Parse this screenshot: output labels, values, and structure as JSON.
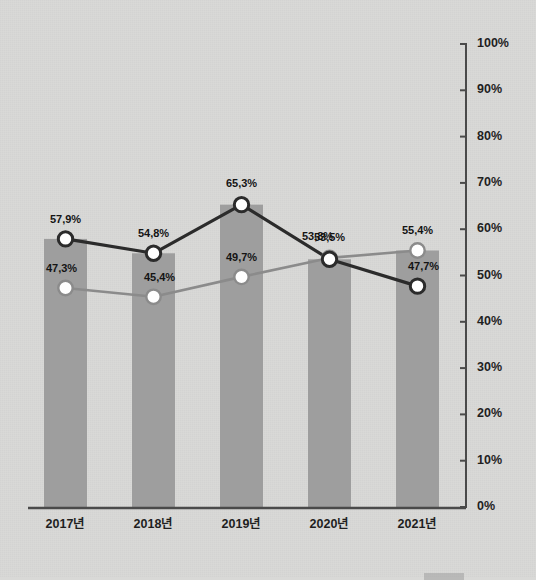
{
  "chart_data": {
    "type": "bar",
    "title": "",
    "subtitle": "",
    "xlabel": "",
    "ylabel": "",
    "categories": [
      "2017년",
      "2018년",
      "2019년",
      "2020년",
      "2021년"
    ],
    "ylim": [
      0,
      100
    ],
    "ytick_values": [
      0,
      10,
      20,
      30,
      40,
      50,
      60,
      70,
      80,
      90,
      100
    ],
    "ytick_labels": [
      "0%",
      "10%",
      "20%",
      "30%",
      "40%",
      "50%",
      "60%",
      "70%",
      "80%",
      "90%",
      "100%"
    ],
    "grid": false,
    "axis_position": "right",
    "legend_position": "bottom-right",
    "series": [
      {
        "name": "bar-series",
        "type": "bar",
        "color": "#9e9e9e",
        "values": [
          57.9,
          54.8,
          65.3,
          53.5,
          55.4
        ],
        "labels": [
          "57,9%",
          "54,8%",
          "65,3%",
          "53,5%",
          "55,4%"
        ]
      },
      {
        "name": "dark-line-series",
        "type": "line",
        "color": "#2b2b2b",
        "marker": "circle-white-fill-dark-ring",
        "values": [
          57.9,
          54.8,
          65.3,
          53.5,
          47.7
        ],
        "labels": [
          "57,9%",
          "54,8%",
          "65,3%",
          "53,5%",
          "47,7%"
        ]
      },
      {
        "name": "light-line-series",
        "type": "line",
        "color": "#8b8b8b",
        "marker": "circle-white-fill-gray-ring",
        "values": [
          47.3,
          45.4,
          49.7,
          53.8,
          55.4
        ],
        "labels": [
          "47,3%",
          "45,4%",
          "49,7%",
          "53,8%",
          "55,4%"
        ]
      }
    ]
  },
  "axis": {
    "ticks": [
      {
        "label": "100%",
        "value": 100
      },
      {
        "label": "90%",
        "value": 90
      },
      {
        "label": "80%",
        "value": 80
      },
      {
        "label": "70%",
        "value": 70
      },
      {
        "label": "60%",
        "value": 60
      },
      {
        "label": "50%",
        "value": 50
      },
      {
        "label": "40%",
        "value": 40
      },
      {
        "label": "30%",
        "value": 30
      },
      {
        "label": "20%",
        "value": 20
      },
      {
        "label": "10%",
        "value": 10
      },
      {
        "label": "0%",
        "value": 0
      }
    ]
  },
  "categories": [
    {
      "label": "2017년"
    },
    {
      "label": "2018년"
    },
    {
      "label": "2019년"
    },
    {
      "label": "2020년"
    },
    {
      "label": "2021년"
    }
  ],
  "legend": {
    "items": [
      {
        "label": "",
        "color": "#9e9e9e"
      }
    ]
  },
  "colors": {
    "background": "#d9d9d7",
    "bar": "#9e9e9e",
    "dark_line": "#2b2b2b",
    "light_line": "#8b8b8b",
    "axis": "#4a4a4a",
    "text": "#1d1d1d"
  }
}
